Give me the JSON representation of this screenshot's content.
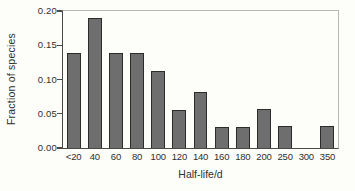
{
  "chart_data": {
    "type": "bar",
    "xlabel": "Half-life/d",
    "ylabel": "Fraction of species",
    "categories": [
      "<20",
      "40",
      "60",
      "80",
      "100",
      "120",
      "140",
      "160",
      "180",
      "200",
      "250",
      "300",
      "350"
    ],
    "values": [
      0.138,
      0.19,
      0.138,
      0.138,
      0.112,
      0.056,
      0.082,
      0.031,
      0.031,
      0.057,
      0.032,
      0,
      0.032
    ],
    "ylim": [
      0,
      0.2
    ],
    "yticks": [
      "0.00",
      "0.05",
      "0.10",
      "0.15",
      "0.20"
    ],
    "grid": false,
    "legend": null,
    "bar_color": "#6e6e6e",
    "bar_border_color": "#2c2c2a",
    "axis_color": "#4a4a47",
    "background_color": "#fdfdfa"
  }
}
